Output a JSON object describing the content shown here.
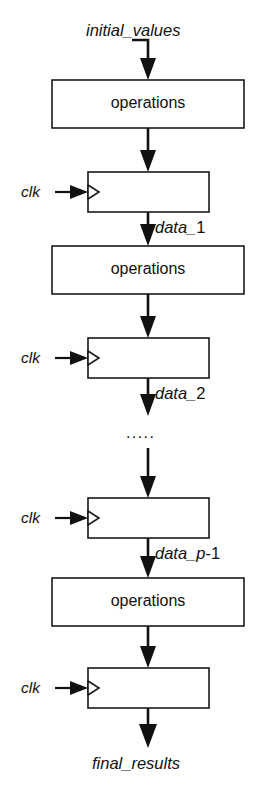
{
  "diagram": {
    "background_color": "#ffffff",
    "line_color": "#111111",
    "box_fill": "#ffffff",
    "box_stroke": "#1a1a1a",
    "width": 266,
    "height": 793
  },
  "signals": {
    "input_label": "initial_values",
    "output_label": "final_results",
    "data_1": {
      "prefix": "data_",
      "index": "1"
    },
    "data_2": {
      "prefix": "data_",
      "index": "2"
    },
    "data_p_minus_1": {
      "prefix": "data_",
      "var": "p",
      "suffix": "-1"
    },
    "ellipsis": "....."
  },
  "blocks": {
    "operations_label": "operations",
    "operations_count": 3,
    "register_count": 4,
    "clock_label": "clk"
  },
  "stages": [
    {
      "kind": "operations",
      "label": "operations",
      "output_label": ""
    },
    {
      "kind": "register",
      "label": "",
      "clock": "clk",
      "output_label": "data_1"
    },
    {
      "kind": "operations",
      "label": "operations",
      "output_label": ""
    },
    {
      "kind": "register",
      "label": "",
      "clock": "clk",
      "output_label": "data_2"
    },
    {
      "kind": "gap",
      "label": "....."
    },
    {
      "kind": "register",
      "label": "",
      "clock": "clk",
      "output_label": "data_p-1"
    },
    {
      "kind": "operations",
      "label": "operations",
      "output_label": ""
    },
    {
      "kind": "register",
      "label": "",
      "clock": "clk",
      "output_label": "final_results"
    }
  ]
}
